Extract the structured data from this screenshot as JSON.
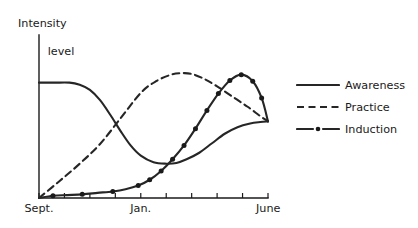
{
  "chart_data": {
    "type": "line",
    "title": "",
    "xlabel": "",
    "ylabel": "Intensity level",
    "ylabel_line1": "Intensity",
    "ylabel_line2": "level",
    "grid": false,
    "legend_position": "right",
    "xlim": [
      0,
      9
    ],
    "ylim": [
      0,
      1
    ],
    "x_tick_labels": [
      "Sept.",
      "Jan.",
      "June"
    ],
    "x_tick_label_positions": [
      0,
      4,
      9
    ],
    "x_tick_count": 9,
    "y_tick_labels": [],
    "axis_note": "y-axis unlabeled (qualitative intensity level); x-axis spans school year Sept. through June",
    "series": [
      {
        "name": "Awareness",
        "style": "solid",
        "markers": false,
        "x": [
          0,
          0.6,
          1.2,
          1.6,
          2.0,
          2.4,
          2.8,
          3.2,
          3.6,
          4.0,
          4.5,
          5.0,
          5.4,
          5.8,
          6.3,
          6.8,
          7.3,
          7.8,
          8.3,
          8.7,
          9.0
        ],
        "y": [
          0.79,
          0.79,
          0.79,
          0.775,
          0.74,
          0.67,
          0.57,
          0.46,
          0.36,
          0.29,
          0.245,
          0.235,
          0.24,
          0.265,
          0.31,
          0.375,
          0.44,
          0.485,
          0.51,
          0.52,
          0.525
        ]
      },
      {
        "name": "Practice",
        "style": "dashed",
        "markers": false,
        "x": [
          0,
          0.8,
          1.6,
          2.4,
          3.2,
          4.0,
          4.6,
          5.2,
          5.6,
          6.0,
          6.5,
          7.0,
          7.6,
          8.2,
          8.7,
          9.0
        ],
        "y": [
          0.0,
          0.115,
          0.235,
          0.37,
          0.545,
          0.72,
          0.8,
          0.845,
          0.855,
          0.85,
          0.815,
          0.765,
          0.695,
          0.625,
          0.56,
          0.525
        ]
      },
      {
        "name": "Induction",
        "style": "dash-dot",
        "markers": true,
        "x": [
          0,
          0.55,
          1.1,
          1.7,
          2.3,
          2.9,
          3.4,
          3.9,
          4.35,
          4.8,
          5.25,
          5.7,
          6.15,
          6.6,
          7.05,
          7.5,
          7.95,
          8.4,
          8.75,
          9.0
        ],
        "y": [
          0.0,
          0.015,
          0.02,
          0.025,
          0.035,
          0.045,
          0.06,
          0.085,
          0.125,
          0.185,
          0.265,
          0.36,
          0.475,
          0.6,
          0.715,
          0.805,
          0.845,
          0.8,
          0.685,
          0.525
        ],
        "marker_x": [
          0.55,
          1.7,
          2.9,
          3.9,
          4.35,
          4.8,
          5.25,
          5.7,
          6.15,
          6.6,
          7.05,
          7.5,
          7.95,
          8.4,
          8.75
        ],
        "marker_y": [
          0.015,
          0.025,
          0.045,
          0.085,
          0.125,
          0.185,
          0.265,
          0.36,
          0.475,
          0.6,
          0.715,
          0.805,
          0.845,
          0.8,
          0.685
        ]
      }
    ],
    "convergence_note": "All three series converge at the right edge (June) at the same intensity level"
  },
  "legend": {
    "items": [
      {
        "label": "Awareness",
        "style": "solid"
      },
      {
        "label": "Practice",
        "style": "dashed"
      },
      {
        "label": "Induction",
        "style": "dash-dot"
      }
    ]
  },
  "colors": {
    "ink": "#1a1a1a",
    "line": "#262626",
    "background": "#ffffff"
  }
}
